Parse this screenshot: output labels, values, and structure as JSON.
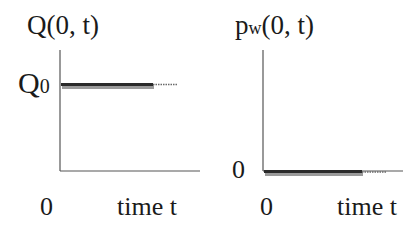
{
  "left_panel": {
    "title": "Q(0, t)",
    "y_tick": {
      "base": "Q",
      "sub": "0"
    },
    "x_origin": "0",
    "x_label": "time t"
  },
  "right_panel": {
    "title_base": "p",
    "title_sub": "w",
    "title_rest": "(0, t)",
    "y_tick": "0",
    "x_origin": "0",
    "x_label": "time t"
  },
  "colors": {
    "axis": "#555555",
    "line": "#2a2a2a",
    "shadow": "#9a9a9a"
  }
}
